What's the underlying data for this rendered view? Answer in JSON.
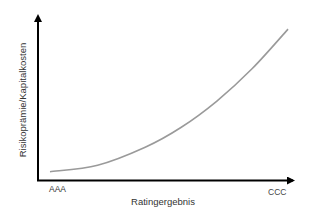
{
  "chart_data": {
    "type": "line",
    "title": "",
    "xlabel": "Ratingergebnis",
    "ylabel": "Risikoprämie/Kapitalkosten",
    "x_tick_labels": [
      "AAA",
      "CCC"
    ],
    "grid": false,
    "legend": null,
    "series": [
      {
        "name": "Risikoprämie",
        "color": "#9a9a9a",
        "description": "convex, exponentially increasing curve from AAA to CCC",
        "points_relative": [
          {
            "x": 0.0,
            "y": 0.05
          },
          {
            "x": 0.2,
            "y": 0.09
          },
          {
            "x": 0.4,
            "y": 0.2
          },
          {
            "x": 0.55,
            "y": 0.32
          },
          {
            "x": 0.7,
            "y": 0.48
          },
          {
            "x": 0.85,
            "y": 0.68
          },
          {
            "x": 1.0,
            "y": 0.92
          }
        ]
      }
    ],
    "axis_color": "#000000"
  }
}
